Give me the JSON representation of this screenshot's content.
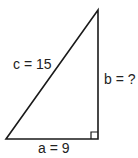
{
  "diagram": {
    "type": "right-triangle",
    "labels": {
      "hypotenuse": "c = 15",
      "vertical_leg": "b = ?",
      "base_leg": "a = 9"
    },
    "right_angle_marker": true,
    "stroke_color": "#1a1a1a",
    "background": "#ffffff"
  }
}
